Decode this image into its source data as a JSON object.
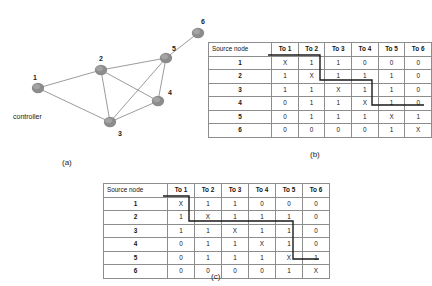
{
  "figure": {
    "captions": {
      "a": "(a)",
      "b": "(b)",
      "c": "(c)"
    }
  },
  "graph": {
    "controller_label": "controller",
    "nodes": [
      {
        "id": "1",
        "label": "1",
        "x": 38,
        "y": 88,
        "label_x": 33,
        "label_y": 74
      },
      {
        "id": "2",
        "label": "2",
        "x": 101,
        "y": 70,
        "label_x": 99,
        "label_y": 55
      },
      {
        "id": "3",
        "label": "3",
        "x": 110,
        "y": 122,
        "label_x": 118,
        "label_y": 130
      },
      {
        "id": "4",
        "label": "4",
        "x": 158,
        "y": 101,
        "label_x": 168,
        "label_y": 89
      },
      {
        "id": "5",
        "label": "5",
        "x": 166,
        "y": 58,
        "label_x": 172,
        "label_y": 45
      },
      {
        "id": "6",
        "label": "6",
        "x": 198,
        "y": 33,
        "label_x": 201,
        "label_y": 18
      }
    ],
    "edges": [
      {
        "from": "1",
        "to": "2"
      },
      {
        "from": "1",
        "to": "3"
      },
      {
        "from": "2",
        "to": "3"
      },
      {
        "from": "2",
        "to": "4"
      },
      {
        "from": "2",
        "to": "5"
      },
      {
        "from": "3",
        "to": "4"
      },
      {
        "from": "3",
        "to": "5"
      },
      {
        "from": "4",
        "to": "5"
      },
      {
        "from": "5",
        "to": "6"
      }
    ],
    "node_color": "#8c8c8c",
    "edge_color": "#8e8e96"
  },
  "table_b": {
    "headers": [
      "Source node",
      "To 1",
      "To 2",
      "To 3",
      "To 4",
      "To 5",
      "To 6"
    ],
    "rows": [
      {
        "source": "1",
        "cells": [
          "X",
          "1",
          "1",
          "0",
          "0",
          "0"
        ]
      },
      {
        "source": "2",
        "cells": [
          "1",
          "X",
          "1",
          "1",
          "1",
          "0"
        ]
      },
      {
        "source": "3",
        "cells": [
          "1",
          "1",
          "X",
          "1",
          "1",
          "0"
        ]
      },
      {
        "source": "4",
        "cells": [
          "0",
          "1",
          "1",
          "X",
          "1",
          "0"
        ]
      },
      {
        "source": "5",
        "cells": [
          "0",
          "1",
          "1",
          "1",
          "X",
          "1"
        ]
      },
      {
        "source": "6",
        "cells": [
          "0",
          "0",
          "0",
          "0",
          "1",
          "X"
        ]
      }
    ]
  },
  "table_c": {
    "headers": [
      "Source node",
      "To 1",
      "To 2",
      "To 3",
      "To 4",
      "To 5",
      "To 6"
    ],
    "rows": [
      {
        "source": "1",
        "cells": [
          "X",
          "1",
          "1",
          "0",
          "0",
          "0"
        ]
      },
      {
        "source": "2",
        "cells": [
          "1",
          "X",
          "1",
          "1",
          "1",
          "0"
        ]
      },
      {
        "source": "3",
        "cells": [
          "1",
          "1",
          "X",
          "1",
          "1",
          "0"
        ]
      },
      {
        "source": "4",
        "cells": [
          "0",
          "1",
          "1",
          "X",
          "1",
          "0"
        ]
      },
      {
        "source": "5",
        "cells": [
          "0",
          "1",
          "1",
          "1",
          "X",
          "1"
        ]
      },
      {
        "source": "6",
        "cells": [
          "0",
          "0",
          "0",
          "0",
          "1",
          "X"
        ]
      }
    ]
  },
  "partition_b": {
    "description": "staircase partition line over matrix b",
    "path": "M 60,13 L 112,13 L 112,38 L 164,38 L 164,63 L 216,63"
  },
  "partition_c": {
    "description": "staircase partition line over matrix c",
    "path": "M 60,13 L 86,13 L 86,38 L 190,38 L 190,76 L 216,76"
  }
}
